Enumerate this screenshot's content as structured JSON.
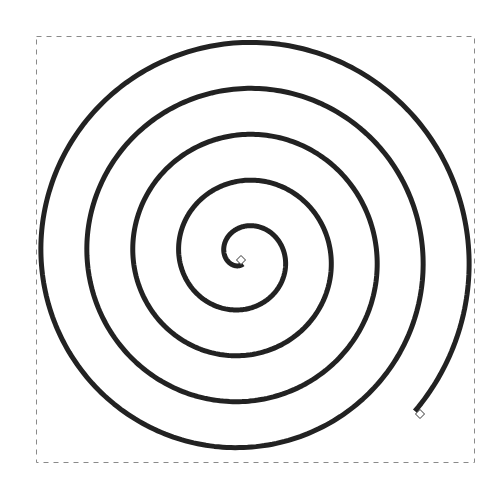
{
  "canvas": {
    "width": 498,
    "height": 488,
    "background": "#ffffff"
  },
  "selection_box": {
    "x": 36,
    "y": 36,
    "width": 438,
    "height": 426,
    "stroke": "#8a8a8a",
    "dash": "5,5"
  },
  "spiral": {
    "type": "archimedean",
    "center_x": 243.5,
    "center_y": 256.5,
    "radius_at_left_start": 18.5,
    "spacing_per_turn": 46,
    "theta_start": 1.65,
    "theta_end": 32.15,
    "direction": "clockwise",
    "turns": 4.9,
    "stroke": "#222222",
    "stroke_width": 5
  },
  "handles": [
    {
      "name": "inner-start-handle",
      "x": 241,
      "y": 260,
      "size": 9,
      "fill": "#ffffff",
      "stroke": "#333333"
    },
    {
      "name": "outer-end-handle",
      "x": 420,
      "y": 414,
      "size": 9,
      "fill": "#ffffff",
      "stroke": "#333333"
    }
  ]
}
